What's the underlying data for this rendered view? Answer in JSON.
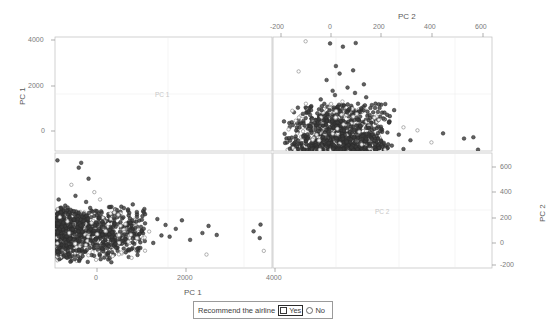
{
  "figure": {
    "type": "scatterplot-matrix",
    "variables": [
      "PC 1",
      "PC 2"
    ]
  },
  "axes": {
    "left": {
      "title": "PC 1",
      "ticks": [
        "4000",
        "2000",
        "0"
      ],
      "values": [
        4000,
        2000,
        0
      ]
    },
    "top": {
      "title": "PC 2",
      "ticks": [
        "-200",
        "0",
        "200",
        "400",
        "600"
      ],
      "values": [
        -200,
        0,
        200,
        400,
        600
      ]
    },
    "right": {
      "title": "PC 2",
      "ticks": [
        "600",
        "400",
        "200",
        "0",
        "-200"
      ],
      "values": [
        600,
        400,
        200,
        0,
        -200
      ]
    },
    "bottom": {
      "title": "PC 1",
      "ticks": [
        "0",
        "2000",
        "4000"
      ],
      "values": [
        0,
        2000,
        4000
      ]
    }
  },
  "panels": {
    "top_left": {
      "label": "PC 1",
      "kind": "diagonal"
    },
    "bottom_right": {
      "label": "PC 2",
      "kind": "diagonal"
    },
    "top_right": {
      "label": "",
      "kind": "scatter",
      "x": "PC 2",
      "y": "PC 1"
    },
    "bottom_left": {
      "label": "",
      "kind": "scatter",
      "x": "PC 1",
      "y": "PC 2"
    }
  },
  "legend": {
    "title": "Recommend the airline",
    "items": [
      {
        "label": "Yes",
        "marker": "square",
        "selected": true,
        "color": "#3a3a3a"
      },
      {
        "label": "No",
        "marker": "circle",
        "selected": false,
        "color": "#6a6a6a"
      }
    ]
  },
  "colors": {
    "yes": "#3a3a3a",
    "no": "#8f8f8f",
    "frame": "#b9b9b9",
    "grid": "#dcdcdc",
    "text": "#5a5a5a"
  },
  "chart_data": {
    "type": "scatter",
    "title": "",
    "xlabel": "PC 1",
    "ylabel": "PC 2",
    "grid": false,
    "legend_position": "bottom",
    "matrix": true,
    "variables": [
      "PC 1",
      "PC 2"
    ],
    "axis_ranges": {
      "PC 1": [
        -700,
        4600
      ],
      "PC 2": [
        -260,
        680
      ]
    },
    "series": [
      {
        "name": "Yes",
        "marker": "filled-circle",
        "color": "#3a3a3a",
        "n": 560
      },
      {
        "name": "No",
        "marker": "open-circle",
        "color": "#8f8f8f",
        "n": 120
      }
    ],
    "points_pc1_pc2": [
      [
        -620,
        60
      ],
      [
        -600,
        -10
      ],
      [
        -590,
        110
      ],
      [
        -575,
        35
      ],
      [
        -560,
        -60
      ],
      [
        -550,
        160
      ],
      [
        -540,
        10
      ],
      [
        -530,
        90
      ],
      [
        -520,
        -40
      ],
      [
        -515,
        140
      ],
      [
        -505,
        55
      ],
      [
        -500,
        -90
      ],
      [
        -495,
        200
      ],
      [
        -488,
        20
      ],
      [
        -480,
        120
      ],
      [
        -475,
        -25
      ],
      [
        -470,
        75
      ],
      [
        -465,
        175
      ],
      [
        -458,
        -55
      ],
      [
        -450,
        40
      ],
      [
        -445,
        105
      ],
      [
        -440,
        -5
      ],
      [
        -435,
        150
      ],
      [
        -430,
        65
      ],
      [
        -425,
        -70
      ],
      [
        -420,
        190
      ],
      [
        -415,
        25
      ],
      [
        -410,
        95
      ],
      [
        -405,
        -35
      ],
      [
        -400,
        135
      ],
      [
        -395,
        50
      ],
      [
        -390,
        -100
      ],
      [
        -385,
        215
      ],
      [
        -380,
        15
      ],
      [
        -375,
        115
      ],
      [
        -370,
        -20
      ],
      [
        -365,
        80
      ],
      [
        -360,
        165
      ],
      [
        -355,
        -50
      ],
      [
        -350,
        45
      ],
      [
        -345,
        100
      ],
      [
        -340,
        0
      ],
      [
        -335,
        145
      ],
      [
        -330,
        70
      ],
      [
        -325,
        -65
      ],
      [
        -320,
        185
      ],
      [
        -315,
        30
      ],
      [
        -310,
        90
      ],
      [
        -305,
        -30
      ],
      [
        -300,
        130
      ],
      [
        -295,
        55
      ],
      [
        -290,
        -85
      ],
      [
        -285,
        205
      ],
      [
        -280,
        18
      ],
      [
        -275,
        112
      ],
      [
        -270,
        -18
      ],
      [
        -265,
        78
      ],
      [
        -260,
        168
      ],
      [
        -255,
        -48
      ],
      [
        -250,
        42
      ],
      [
        -245,
        102
      ],
      [
        -240,
        2
      ],
      [
        -235,
        142
      ],
      [
        -230,
        68
      ],
      [
        -225,
        -62
      ],
      [
        -220,
        182
      ],
      [
        -215,
        28
      ],
      [
        -210,
        88
      ],
      [
        -205,
        -28
      ],
      [
        -200,
        128
      ],
      [
        -195,
        52
      ],
      [
        -190,
        -82
      ],
      [
        -185,
        202
      ],
      [
        -180,
        16
      ],
      [
        -175,
        110
      ],
      [
        -170,
        -16
      ],
      [
        -165,
        76
      ],
      [
        -160,
        166
      ],
      [
        -155,
        -46
      ],
      [
        -150,
        40
      ],
      [
        -145,
        98
      ],
      [
        -140,
        4
      ],
      [
        -135,
        138
      ],
      [
        -130,
        64
      ],
      [
        -125,
        -58
      ],
      [
        -120,
        178
      ],
      [
        -115,
        26
      ],
      [
        -110,
        86
      ],
      [
        -105,
        -26
      ],
      [
        -100,
        124
      ],
      [
        -95,
        48
      ],
      [
        -90,
        -78
      ],
      [
        -85,
        198
      ],
      [
        -80,
        14
      ],
      [
        -75,
        108
      ],
      [
        -70,
        -14
      ],
      [
        -65,
        72
      ],
      [
        -60,
        162
      ],
      [
        -55,
        -44
      ],
      [
        -50,
        38
      ],
      [
        -45,
        96
      ],
      [
        -40,
        6
      ],
      [
        -35,
        134
      ],
      [
        -30,
        62
      ],
      [
        -25,
        -54
      ],
      [
        -20,
        174
      ],
      [
        -15,
        24
      ],
      [
        -10,
        84
      ],
      [
        -5,
        -24
      ],
      [
        0,
        120
      ],
      [
        5,
        46
      ],
      [
        10,
        -74
      ],
      [
        15,
        194
      ],
      [
        20,
        12
      ],
      [
        25,
        106
      ],
      [
        30,
        -12
      ],
      [
        35,
        70
      ],
      [
        40,
        158
      ],
      [
        45,
        -42
      ],
      [
        50,
        36
      ],
      [
        55,
        94
      ],
      [
        60,
        8
      ],
      [
        65,
        130
      ],
      [
        70,
        60
      ],
      [
        75,
        -52
      ],
      [
        80,
        170
      ],
      [
        85,
        22
      ],
      [
        90,
        82
      ],
      [
        95,
        -22
      ],
      [
        100,
        118
      ],
      [
        110,
        44
      ],
      [
        120,
        -70
      ],
      [
        130,
        190
      ],
      [
        140,
        10
      ],
      [
        150,
        104
      ],
      [
        160,
        -10
      ],
      [
        170,
        68
      ],
      [
        180,
        155
      ],
      [
        190,
        -40
      ],
      [
        200,
        34
      ],
      [
        210,
        92
      ],
      [
        220,
        14
      ],
      [
        230,
        126
      ],
      [
        240,
        58
      ],
      [
        250,
        -50
      ],
      [
        260,
        166
      ],
      [
        270,
        20
      ],
      [
        280,
        80
      ],
      [
        290,
        -20
      ],
      [
        300,
        114
      ],
      [
        320,
        42
      ],
      [
        340,
        -66
      ],
      [
        360,
        186
      ],
      [
        380,
        9
      ],
      [
        400,
        100
      ],
      [
        420,
        -8
      ],
      [
        440,
        66
      ],
      [
        460,
        150
      ],
      [
        480,
        -38
      ],
      [
        500,
        32
      ],
      [
        520,
        90
      ],
      [
        540,
        16
      ],
      [
        560,
        122
      ],
      [
        580,
        56
      ],
      [
        600,
        -46
      ],
      [
        620,
        162
      ],
      [
        640,
        18
      ],
      [
        660,
        78
      ],
      [
        680,
        -18
      ],
      [
        700,
        110
      ],
      [
        730,
        40
      ],
      [
        760,
        -60
      ],
      [
        790,
        180
      ],
      [
        820,
        8
      ],
      [
        850,
        98
      ],
      [
        880,
        -6
      ],
      [
        910,
        64
      ],
      [
        940,
        145
      ],
      [
        970,
        -34
      ],
      [
        1000,
        30
      ],
      [
        1050,
        88
      ],
      [
        1100,
        12
      ],
      [
        1150,
        118
      ],
      [
        1200,
        54
      ],
      [
        1250,
        -42
      ],
      [
        1300,
        158
      ],
      [
        1350,
        16
      ],
      [
        1400,
        76
      ],
      [
        1450,
        -14
      ],
      [
        1500,
        105
      ],
      [
        1600,
        38
      ],
      [
        1700,
        -55
      ],
      [
        1800,
        140
      ],
      [
        1900,
        6
      ],
      [
        2000,
        92
      ],
      [
        2100,
        -4
      ],
      [
        2250,
        60
      ],
      [
        2400,
        130
      ],
      [
        2600,
        -30
      ],
      [
        2900,
        26
      ],
      [
        3050,
        84
      ],
      [
        3250,
        10
      ],
      [
        4150,
        40
      ],
      [
        4300,
        -15
      ],
      [
        4320,
        95
      ],
      [
        -610,
        300
      ],
      [
        -300,
        420
      ],
      [
        -120,
        560
      ],
      [
        -60,
        600
      ],
      [
        120,
        470
      ],
      [
        260,
        360
      ],
      [
        -450,
        250
      ],
      [
        -200,
        330
      ],
      [
        60,
        280
      ],
      [
        400,
        300
      ],
      [
        680,
        240
      ],
      [
        900,
        200
      ],
      [
        1200,
        260
      ],
      [
        1500,
        180
      ],
      [
        -640,
        620
      ],
      [
        4400,
        -120
      ],
      [
        3000,
        -150
      ],
      [
        -560,
        -180
      ],
      [
        -300,
        -200
      ],
      [
        100,
        -210
      ],
      [
        600,
        -190
      ],
      [
        1100,
        -170
      ]
    ]
  }
}
